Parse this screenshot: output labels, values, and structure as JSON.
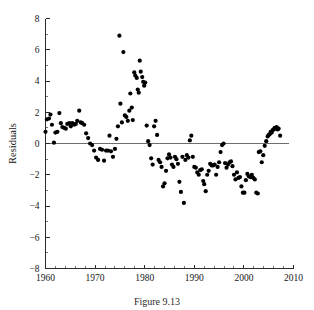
{
  "figure": {
    "caption": "Figure 9.13"
  },
  "chart_data": {
    "type": "scatter",
    "title": "",
    "subtitle": "",
    "xlabel": "",
    "ylabel": "Residuals",
    "xlim": [
      1960,
      2010
    ],
    "ylim": [
      -8,
      8
    ],
    "grid": false,
    "legend": null,
    "x_ticks": [
      1960,
      1970,
      1980,
      1990,
      2000,
      2010
    ],
    "x_tick_labels": [
      "1960",
      "1970",
      "1980",
      "1990",
      "2000",
      "2010"
    ],
    "x_minor_tick_step": 2,
    "y_ticks": [
      8,
      6,
      4,
      2,
      0,
      -2,
      -4,
      -6,
      -8
    ],
    "y_tick_labels": [
      "8",
      "6",
      "4",
      "2",
      "0",
      "−2",
      "−4",
      "−6",
      "−8"
    ],
    "y_minor_tick_step": 1,
    "reference_line": {
      "orientation": "horizontal",
      "y": 0,
      "x_start": 1960,
      "x_end": 2009,
      "color": "#6e6e6e"
    },
    "marker": {
      "shape": "circle",
      "color": "#000000",
      "radius_px": 2.1
    },
    "series": [
      {
        "name": "Residuals",
        "color": "#000000",
        "points": [
          [
            1960.0,
            0.75
          ],
          [
            1960.3,
            1.55
          ],
          [
            1960.7,
            1.6
          ],
          [
            1961.0,
            1.85
          ],
          [
            1961.3,
            1.2
          ],
          [
            1961.7,
            0.05
          ],
          [
            1962.0,
            0.7
          ],
          [
            1962.4,
            0.75
          ],
          [
            1962.8,
            1.95
          ],
          [
            1963.1,
            1.3
          ],
          [
            1963.4,
            1.05
          ],
          [
            1963.8,
            1.0
          ],
          [
            1964.1,
            0.95
          ],
          [
            1964.4,
            1.25
          ],
          [
            1964.8,
            1.3
          ],
          [
            1965.1,
            1.1
          ],
          [
            1965.4,
            1.3
          ],
          [
            1965.8,
            1.2
          ],
          [
            1966.1,
            1.25
          ],
          [
            1966.4,
            1.45
          ],
          [
            1966.8,
            2.1
          ],
          [
            1967.1,
            1.35
          ],
          [
            1967.4,
            1.3
          ],
          [
            1967.8,
            1.2
          ],
          [
            1968.2,
            0.65
          ],
          [
            1968.6,
            0.35
          ],
          [
            1969.0,
            0.0
          ],
          [
            1969.4,
            -0.1
          ],
          [
            1969.8,
            -0.45
          ],
          [
            1970.2,
            -0.9
          ],
          [
            1970.6,
            -1.05
          ],
          [
            1971.0,
            -0.35
          ],
          [
            1971.4,
            -0.4
          ],
          [
            1971.8,
            -1.1
          ],
          [
            1972.2,
            -0.45
          ],
          [
            1972.6,
            -0.45
          ],
          [
            1972.9,
            0.5
          ],
          [
            1973.2,
            -0.5
          ],
          [
            1973.6,
            -0.85
          ],
          [
            1974.0,
            -0.35
          ],
          [
            1974.3,
            0.3
          ],
          [
            1974.6,
            1.1
          ],
          [
            1974.9,
            6.9
          ],
          [
            1975.1,
            2.55
          ],
          [
            1975.4,
            1.35
          ],
          [
            1975.7,
            5.85
          ],
          [
            1976.0,
            1.8
          ],
          [
            1976.3,
            1.7
          ],
          [
            1976.6,
            1.45
          ],
          [
            1976.9,
            2.1
          ],
          [
            1977.1,
            3.2
          ],
          [
            1977.4,
            2.3
          ],
          [
            1977.6,
            1.5
          ],
          [
            1977.9,
            4.55
          ],
          [
            1978.1,
            4.35
          ],
          [
            1978.4,
            4.2
          ],
          [
            1978.6,
            3.45
          ],
          [
            1978.8,
            3.25
          ],
          [
            1979.0,
            5.3
          ],
          [
            1979.2,
            4.6
          ],
          [
            1979.5,
            4.25
          ],
          [
            1979.7,
            3.95
          ],
          [
            1979.9,
            3.7
          ],
          [
            1980.1,
            3.9
          ],
          [
            1980.4,
            1.15
          ],
          [
            1980.7,
            0.15
          ],
          [
            1981.0,
            -0.1
          ],
          [
            1981.3,
            -0.95
          ],
          [
            1981.6,
            -1.35
          ],
          [
            1981.9,
            1.1
          ],
          [
            1982.2,
            1.45
          ],
          [
            1982.5,
            0.55
          ],
          [
            1982.8,
            -1.05
          ],
          [
            1983.1,
            -1.2
          ],
          [
            1983.4,
            -1.5
          ],
          [
            1983.7,
            -2.75
          ],
          [
            1984.0,
            -2.55
          ],
          [
            1984.3,
            -1.75
          ],
          [
            1984.6,
            -0.95
          ],
          [
            1984.9,
            -0.7
          ],
          [
            1985.2,
            -0.9
          ],
          [
            1985.5,
            -1.35
          ],
          [
            1985.8,
            -1.5
          ],
          [
            1986.1,
            -0.85
          ],
          [
            1986.4,
            -1.0
          ],
          [
            1986.7,
            -1.3
          ],
          [
            1987.0,
            -2.45
          ],
          [
            1987.3,
            -3.1
          ],
          [
            1987.6,
            -0.85
          ],
          [
            1987.9,
            -3.8
          ],
          [
            1988.2,
            -1.05
          ],
          [
            1988.5,
            -0.75
          ],
          [
            1988.8,
            -0.9
          ],
          [
            1989.1,
            0.2
          ],
          [
            1989.4,
            0.5
          ],
          [
            1989.7,
            -0.85
          ],
          [
            1990.0,
            -1.5
          ],
          [
            1990.3,
            -1.55
          ],
          [
            1990.6,
            -1.85
          ],
          [
            1990.9,
            -2.0
          ],
          [
            1991.2,
            -1.7
          ],
          [
            1991.5,
            -1.65
          ],
          [
            1991.8,
            -2.4
          ],
          [
            1992.0,
            -2.6
          ],
          [
            1992.3,
            -3.05
          ],
          [
            1992.6,
            -2.0
          ],
          [
            1992.9,
            -1.75
          ],
          [
            1993.2,
            -1.3
          ],
          [
            1993.5,
            -1.4
          ],
          [
            1993.8,
            -1.4
          ],
          [
            1994.1,
            -1.35
          ],
          [
            1994.4,
            -2.0
          ],
          [
            1994.7,
            -1.5
          ],
          [
            1995.0,
            -1.2
          ],
          [
            1995.3,
            -0.55
          ],
          [
            1995.6,
            -0.1
          ],
          [
            1995.9,
            0.0
          ],
          [
            1996.2,
            -1.25
          ],
          [
            1996.5,
            -1.55
          ],
          [
            1996.8,
            -1.35
          ],
          [
            1997.1,
            -1.2
          ],
          [
            1997.4,
            -1.15
          ],
          [
            1997.7,
            -1.45
          ],
          [
            1998.0,
            -2.0
          ],
          [
            1998.3,
            -2.3
          ],
          [
            1998.6,
            -1.85
          ],
          [
            1998.9,
            -2.2
          ],
          [
            1999.2,
            -2.15
          ],
          [
            1999.5,
            -2.75
          ],
          [
            1999.8,
            -3.15
          ],
          [
            2000.1,
            -3.15
          ],
          [
            2000.4,
            -2.35
          ],
          [
            2000.7,
            -1.95
          ],
          [
            2001.0,
            -2.1
          ],
          [
            2001.3,
            -2.15
          ],
          [
            2001.6,
            -2.0
          ],
          [
            2001.9,
            -2.2
          ],
          [
            2002.2,
            -2.3
          ],
          [
            2002.5,
            -3.15
          ],
          [
            2002.8,
            -3.2
          ],
          [
            2003.0,
            -0.55
          ],
          [
            2003.3,
            -0.5
          ],
          [
            2003.6,
            -1.2
          ],
          [
            2003.9,
            -0.75
          ],
          [
            2004.2,
            -0.15
          ],
          [
            2004.5,
            0.15
          ],
          [
            2004.8,
            0.45
          ],
          [
            2005.0,
            0.55
          ],
          [
            2005.2,
            0.6
          ],
          [
            2005.4,
            0.75
          ],
          [
            2005.6,
            0.7
          ],
          [
            2005.8,
            0.85
          ],
          [
            2006.0,
            0.9
          ],
          [
            2006.2,
            1.0
          ],
          [
            2006.4,
            0.95
          ],
          [
            2006.6,
            1.05
          ],
          [
            2006.8,
            0.9
          ],
          [
            2007.0,
            0.95
          ],
          [
            2007.3,
            0.5
          ]
        ]
      }
    ]
  }
}
